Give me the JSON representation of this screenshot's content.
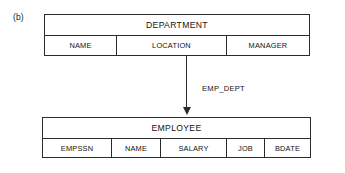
{
  "figure": {
    "label": "(b)",
    "stroke_color": "#2b2b2b",
    "text_color": "#111111",
    "background_color": "#ffffff"
  },
  "diagram": {
    "type": "relational-schema",
    "entities": [
      {
        "name": "DEPARTMENT",
        "attributes": [
          {
            "label": "NAME"
          },
          {
            "label": "LOCATION"
          },
          {
            "label": "MANAGER"
          }
        ]
      },
      {
        "name": "EMPLOYEE",
        "attributes": [
          {
            "label": "EMPSSN"
          },
          {
            "label": "NAME"
          },
          {
            "label": "SALARY"
          },
          {
            "label": "JOB"
          },
          {
            "label": "BDATE"
          }
        ]
      }
    ],
    "relationships": [
      {
        "label": "EMP_DEPT",
        "from": "DEPARTMENT",
        "to": "EMPLOYEE",
        "direction": "down"
      }
    ]
  }
}
